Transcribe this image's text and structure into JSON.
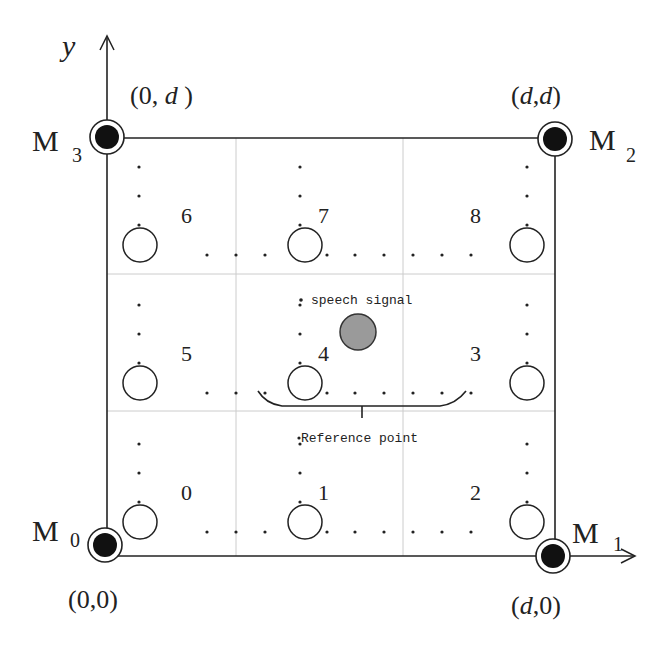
{
  "axes": {
    "x_label": "x",
    "y_label": "y"
  },
  "microphones": [
    {
      "id": "M0",
      "name": "M",
      "sub": "0",
      "coord": "(0,0)",
      "corner": "bottom-left"
    },
    {
      "id": "M1",
      "name": "M",
      "sub": "1",
      "coord": "(d,0)",
      "corner": "bottom-right"
    },
    {
      "id": "M2",
      "name": "M",
      "sub": "2",
      "coord": "(d,d)",
      "corner": "top-right"
    },
    {
      "id": "M3",
      "name": "M",
      "sub": "3",
      "coord": "(0, d )",
      "corner": "top-left"
    }
  ],
  "grid": {
    "rows": 3,
    "cols": 3
  },
  "positions": [
    {
      "label": "0",
      "row": 0,
      "col": 0
    },
    {
      "label": "1",
      "row": 0,
      "col": 1
    },
    {
      "label": "2",
      "row": 0,
      "col": 2
    },
    {
      "label": "3",
      "row": 1,
      "col": 2
    },
    {
      "label": "4",
      "row": 1,
      "col": 1
    },
    {
      "label": "5",
      "row": 1,
      "col": 0
    },
    {
      "label": "6",
      "row": 2,
      "col": 0
    },
    {
      "label": "7",
      "row": 2,
      "col": 1
    },
    {
      "label": "8",
      "row": 2,
      "col": 2
    }
  ],
  "annotations": {
    "speech_signal": "speech signal",
    "reference_point": "Reference point"
  },
  "colors": {
    "line": "#222222",
    "grid": "#cccccc",
    "mic_fill": "#111111",
    "speech_fill": "#999999"
  }
}
